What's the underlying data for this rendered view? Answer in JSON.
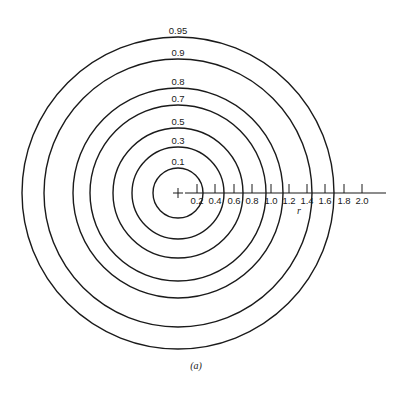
{
  "figure": {
    "caption": "(a)",
    "axis_label": "r",
    "center": {
      "x": 178,
      "y": 193
    },
    "stroke_color": "#1a1a1a",
    "background": "#ffffff"
  },
  "circles": [
    {
      "label": "0.1",
      "radius": 25
    },
    {
      "label": "0.3",
      "radius": 46
    },
    {
      "label": "0.5",
      "radius": 65
    },
    {
      "label": "0.7",
      "radius": 88
    },
    {
      "label": "0.8",
      "radius": 105
    },
    {
      "label": "0.9",
      "radius": 134
    },
    {
      "label": "0.95",
      "radius": 156
    }
  ],
  "axis": {
    "start_x": 185,
    "end_x": 386,
    "ticks": [
      "0.2",
      "0.4",
      "0.6",
      "0.8",
      "1.0",
      "1.2",
      "1.4",
      "1.6",
      "1.8",
      "2.0"
    ],
    "tick_x": [
      197,
      215,
      234,
      252,
      271,
      289,
      307,
      325,
      344,
      362
    ]
  }
}
